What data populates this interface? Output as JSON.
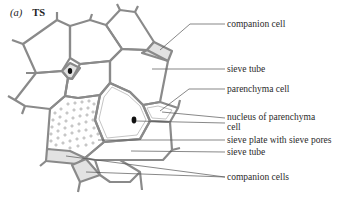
{
  "figure": {
    "panel_label": "(a)",
    "section_label": "TS",
    "labels": [
      {
        "id": "companion-cell",
        "text": "companion cell",
        "x": 227,
        "y": 19
      },
      {
        "id": "sieve-tube-1",
        "text": "sieve tube",
        "x": 227,
        "y": 63
      },
      {
        "id": "parenchyma-cell",
        "text": "parenchyma cell",
        "x": 227,
        "y": 84
      },
      {
        "id": "nucleus-of-parenchyma-cell",
        "text": "nucleus of parenchyma",
        "text2": "cell",
        "x": 227,
        "y": 112
      },
      {
        "id": "sieve-plate",
        "text": "sieve plate with sieve pores",
        "x": 227,
        "y": 135
      },
      {
        "id": "sieve-tube-2",
        "text": "sieve tube",
        "x": 227,
        "y": 148
      },
      {
        "id": "companion-cells",
        "text": "companion cells",
        "x": 227,
        "y": 171
      }
    ]
  },
  "colors": {
    "wall": "#8a8a8a",
    "fill_shaded": "#e2e2e2",
    "nucleus": "#111111",
    "leader": "#555555",
    "text": "#2a2a2a"
  }
}
